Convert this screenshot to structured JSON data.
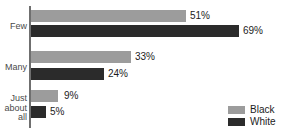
{
  "chart_data": {
    "type": "bar",
    "orientation": "horizontal",
    "title": "",
    "title_remnant": "",
    "xlabel": "",
    "ylabel": "",
    "categories": [
      "Few",
      "Many",
      "Just about all"
    ],
    "series": [
      {
        "name": "Black",
        "color": "#9c9c9c",
        "values": [
          51,
          33,
          9
        ],
        "value_labels": [
          "51%",
          "33%",
          "9%"
        ]
      },
      {
        "name": "White",
        "color": "#2b2b2b",
        "values": [
          69,
          24,
          5
        ],
        "value_labels": [
          "69%",
          "24%",
          "5%"
        ]
      }
    ],
    "value_suffix": "%",
    "xlim": [
      0,
      70
    ],
    "grid": false,
    "legend_position": "bottom-right"
  },
  "axis": {
    "category_labels": {
      "few": "Few",
      "many": "Many",
      "just": "Just",
      "about": "about",
      "all": "all"
    }
  },
  "values": {
    "few_black": "51%",
    "few_white": "69%",
    "many_black": "33%",
    "many_white": "24%",
    "all_black": "9%",
    "all_white": "5%"
  },
  "legend": {
    "items": [
      {
        "label": "Black",
        "color": "#9c9c9c"
      },
      {
        "label": "White",
        "color": "#2b2b2b"
      }
    ],
    "black_label": "Black",
    "white_label": "White"
  }
}
